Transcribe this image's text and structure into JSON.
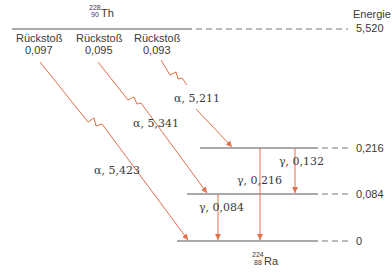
{
  "diagram": {
    "type": "nuclear-decay-scheme",
    "parent": {
      "mass": "228",
      "atomic": "90",
      "symbol": "Th"
    },
    "daughter": {
      "mass": "224",
      "atomic": "88",
      "symbol": "Ra"
    },
    "axis_label": "Energie",
    "levels": [
      {
        "id": "parent",
        "value": "5,520"
      },
      {
        "id": "l216",
        "value": "0,216"
      },
      {
        "id": "l084",
        "value": "0,084"
      },
      {
        "id": "ground",
        "value": "0"
      }
    ],
    "recoils": [
      {
        "label": "Rückstoß",
        "value": "0,097"
      },
      {
        "label": "Rückstoß",
        "value": "0,095"
      },
      {
        "label": "Rückstoß",
        "value": "0,093"
      }
    ],
    "alpha_transitions": [
      {
        "label": "α, 5,423",
        "to": "0"
      },
      {
        "label": "α, 5,341",
        "to": "0,084"
      },
      {
        "label": "α, 5,211",
        "to": "0,216"
      }
    ],
    "gamma_transitions": [
      {
        "label": "γ, 0,132",
        "from": "0,216",
        "to": "0,084"
      },
      {
        "label": "γ, 0,216",
        "from": "0,216",
        "to": "0"
      },
      {
        "label": "γ, 0,084",
        "from": "0,084",
        "to": "0"
      }
    ],
    "colors": {
      "line": "#555555",
      "arrow": "#e0704a",
      "text": "#3a3a3a"
    }
  }
}
